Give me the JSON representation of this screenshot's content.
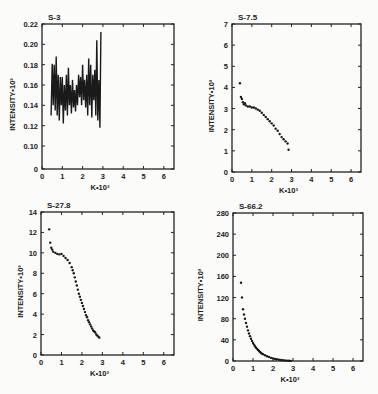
{
  "chart_data": [
    {
      "type": "line",
      "title": "S-3",
      "xlabel": "K•10³",
      "ylabel": "INTENSITY•10³",
      "xlim": [
        0,
        6.5
      ],
      "xticks": [
        "0",
        "1",
        "2",
        "3",
        "4",
        "5",
        "6"
      ],
      "yticks": [
        "0",
        "0.10",
        "0.12",
        "0.14",
        "0.16",
        "0.18",
        "0.20",
        "0.22"
      ],
      "y_axis_break": "0 then 0.10–0.22",
      "ylim": [
        0.1,
        0.22
      ],
      "series": [
        {
          "name": "S-3",
          "x": [
            0.45,
            0.5,
            0.55,
            0.6,
            0.65,
            0.7,
            0.75,
            0.8,
            0.85,
            0.9,
            0.95,
            1.0,
            1.05,
            1.1,
            1.15,
            1.2,
            1.25,
            1.3,
            1.35,
            1.4,
            1.45,
            1.5,
            1.55,
            1.6,
            1.65,
            1.7,
            1.75,
            1.8,
            1.85,
            1.9,
            1.95,
            2.0,
            2.05,
            2.1,
            2.15,
            2.2,
            2.25,
            2.3,
            2.35,
            2.4,
            2.45,
            2.5,
            2.55,
            2.6,
            2.65,
            2.7,
            2.75,
            2.8,
            2.85,
            2.9
          ],
          "y": [
            0.13,
            0.181,
            0.14,
            0.18,
            0.135,
            0.188,
            0.13,
            0.17,
            0.125,
            0.168,
            0.14,
            0.168,
            0.122,
            0.16,
            0.135,
            0.17,
            0.13,
            0.177,
            0.14,
            0.16,
            0.132,
            0.165,
            0.138,
            0.155,
            0.134,
            0.16,
            0.14,
            0.17,
            0.148,
            0.168,
            0.14,
            0.18,
            0.145,
            0.165,
            0.138,
            0.17,
            0.13,
            0.186,
            0.14,
            0.18,
            0.128,
            0.17,
            0.145,
            0.175,
            0.13,
            0.204,
            0.125,
            0.165,
            0.118,
            0.212
          ]
        }
      ]
    },
    {
      "type": "scatter",
      "title": "S-7.5",
      "xlabel": "K•10³",
      "ylabel": "INTENSITY•10³",
      "xlim": [
        0,
        6.5
      ],
      "ylim": [
        0,
        7
      ],
      "xticks": [
        "0",
        "1",
        "2",
        "3",
        "4",
        "5",
        "6"
      ],
      "yticks": [
        "0",
        "1",
        "2",
        "3",
        "4",
        "5",
        "6",
        "7"
      ],
      "series": [
        {
          "name": "S-7.5",
          "x": [
            0.4,
            0.45,
            0.5,
            0.55,
            0.6,
            0.65,
            0.7,
            0.8,
            0.9,
            1.0,
            1.1,
            1.2,
            1.3,
            1.4,
            1.5,
            1.6,
            1.7,
            1.8,
            1.9,
            2.0,
            2.1,
            2.2,
            2.3,
            2.4,
            2.5,
            2.6,
            2.7,
            2.8,
            2.85
          ],
          "y": [
            4.2,
            3.55,
            3.45,
            3.3,
            3.2,
            3.25,
            3.15,
            3.1,
            3.1,
            3.05,
            3.05,
            3.0,
            2.95,
            2.9,
            2.8,
            2.7,
            2.6,
            2.5,
            2.4,
            2.3,
            2.2,
            2.05,
            1.95,
            1.8,
            1.65,
            1.55,
            1.45,
            1.35,
            1.05
          ]
        }
      ]
    },
    {
      "type": "scatter",
      "title": "S-27.8",
      "xlabel": "K•10³",
      "ylabel": "INTENSITY•10³",
      "xlim": [
        0,
        6.5
      ],
      "ylim": [
        0,
        14
      ],
      "xticks": [
        "0",
        "1",
        "2",
        "3",
        "4",
        "5",
        "6"
      ],
      "yticks": [
        "0",
        "2",
        "4",
        "6",
        "8",
        "10",
        "12",
        "14"
      ],
      "series": [
        {
          "name": "S-27.8",
          "x": [
            0.4,
            0.45,
            0.5,
            0.55,
            0.6,
            0.7,
            0.8,
            0.9,
            1.0,
            1.1,
            1.2,
            1.3,
            1.4,
            1.5,
            1.55,
            1.6,
            1.65,
            1.7,
            1.75,
            1.8,
            1.85,
            1.9,
            1.95,
            2.0,
            2.05,
            2.1,
            2.15,
            2.2,
            2.25,
            2.3,
            2.35,
            2.4,
            2.45,
            2.5,
            2.55,
            2.6,
            2.65,
            2.7,
            2.75,
            2.8,
            2.85
          ],
          "y": [
            12.3,
            11.0,
            10.5,
            10.3,
            10.1,
            10.0,
            9.9,
            9.85,
            9.9,
            9.7,
            9.5,
            9.3,
            9.0,
            8.6,
            8.3,
            8.0,
            7.6,
            7.2,
            6.8,
            6.4,
            6.0,
            5.7,
            5.4,
            5.1,
            4.8,
            4.5,
            4.2,
            3.9,
            3.7,
            3.4,
            3.2,
            3.0,
            2.8,
            2.6,
            2.4,
            2.3,
            2.2,
            2.0,
            1.9,
            1.8,
            1.7
          ]
        }
      ]
    },
    {
      "type": "scatter",
      "title": "S-66.2",
      "xlabel": "K•10³",
      "ylabel": "INTENSITY•10³",
      "xlim": [
        0,
        6.5
      ],
      "ylim": [
        0,
        280
      ],
      "xticks": [
        "0",
        "1",
        "2",
        "3",
        "4",
        "5",
        "6"
      ],
      "yticks": [
        "0",
        "40",
        "80",
        "120",
        "160",
        "200",
        "240",
        "280"
      ],
      "series": [
        {
          "name": "S-66.2",
          "x": [
            0.4,
            0.45,
            0.5,
            0.55,
            0.6,
            0.65,
            0.7,
            0.75,
            0.8,
            0.85,
            0.9,
            0.95,
            1.0,
            1.05,
            1.1,
            1.15,
            1.2,
            1.25,
            1.3,
            1.35,
            1.4,
            1.45,
            1.5,
            1.6,
            1.7,
            1.8,
            1.9,
            2.0,
            2.1,
            2.2,
            2.3,
            2.4,
            2.5,
            2.6,
            2.7,
            2.8,
            2.9
          ],
          "y": [
            148,
            120,
            98,
            88,
            80,
            72,
            65,
            58,
            52,
            47,
            42,
            38,
            34,
            31,
            28,
            25,
            23,
            21,
            19,
            17,
            15,
            14,
            13,
            11,
            9,
            7.5,
            6,
            5,
            4,
            3.2,
            2.6,
            2,
            1.5,
            1.1,
            0.8,
            0.5,
            0.3
          ]
        }
      ]
    }
  ]
}
